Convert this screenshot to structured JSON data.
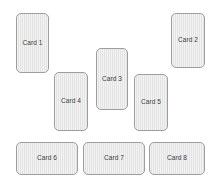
{
  "diagram": {
    "type": "card-layout",
    "background_color": "#ffffff",
    "width": 218,
    "height": 185,
    "card_style": {
      "fill_color": "#e6e6e6",
      "border_color": "#9e9e9e",
      "text_color": "#3a3a3a",
      "corner_radius": 5
    },
    "cards": [
      {
        "label": "Card 1",
        "x": 16,
        "y": 13,
        "w": 33,
        "h": 60
      },
      {
        "label": "Card 2",
        "x": 171,
        "y": 13,
        "w": 34,
        "h": 55
      },
      {
        "label": "Card 3",
        "x": 96,
        "y": 48,
        "w": 32,
        "h": 62
      },
      {
        "label": "Card 4",
        "x": 54,
        "y": 72,
        "w": 34,
        "h": 59
      },
      {
        "label": "Card 5",
        "x": 134,
        "y": 74,
        "w": 34,
        "h": 57
      },
      {
        "label": "Card 6",
        "x": 16,
        "y": 142,
        "w": 62,
        "h": 33
      },
      {
        "label": "Card 7",
        "x": 83,
        "y": 142,
        "w": 62,
        "h": 33
      },
      {
        "label": "Card 8",
        "x": 149,
        "y": 142,
        "w": 56,
        "h": 33
      }
    ]
  }
}
